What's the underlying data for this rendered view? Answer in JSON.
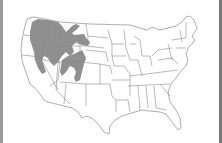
{
  "map": {
    "subject": "United States state outline map",
    "shaded_region_label": "range",
    "colors": {
      "range_fill": "#8f8f8f",
      "state_lines": "#8c8c8c",
      "background": "#fefefe",
      "frame_edge": "#8a8a8a"
    },
    "shaded_states": [
      "Washington (east)",
      "Oregon (east)",
      "Idaho",
      "Montana (west/central)",
      "Nevada (north/east)",
      "Utah",
      "Wyoming (west)",
      "Colorado (west)",
      "California (northeast)"
    ]
  }
}
